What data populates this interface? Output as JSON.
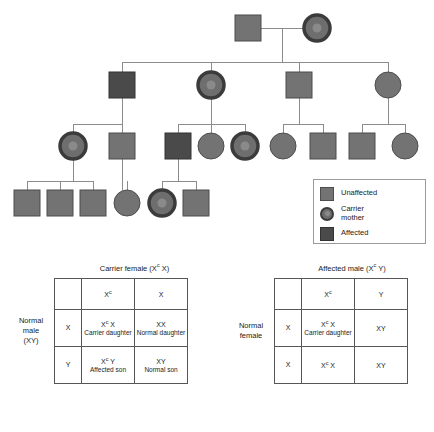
{
  "pedigree": {
    "title": "X-linked recessive inheritance pedigree",
    "colors": {
      "unaffected": "#737373",
      "unaffected_stroke": "#4d4d4d",
      "affected": "#4a4a4a",
      "affected_stroke": "#333333",
      "carrier_ring": "#3b3b3b",
      "carrier_fill": "#6e6e6e",
      "carrier_dot": "#8a8a8a",
      "line": "#8c8c8c"
    },
    "generations": [
      {
        "id": "I",
        "individuals": [
          {
            "name": "gen1-father",
            "shape": "square",
            "status": "unaffected",
            "x": 248,
            "y": 28
          },
          {
            "name": "gen1-mother",
            "shape": "circle",
            "status": "carrier",
            "x": 317,
            "y": 28
          }
        ]
      },
      {
        "id": "II",
        "individuals": [
          {
            "name": "gen2-son-1",
            "shape": "square",
            "status": "affected",
            "x": 122,
            "y": 85
          },
          {
            "name": "gen2-daughter-2",
            "shape": "circle",
            "status": "carrier",
            "x": 211,
            "y": 85
          },
          {
            "name": "gen2-son-3",
            "shape": "square",
            "status": "unaffected",
            "x": 299,
            "y": 85
          },
          {
            "name": "gen2-daughter-4",
            "shape": "circle",
            "status": "unaffected",
            "x": 388,
            "y": 85
          }
        ]
      },
      {
        "id": "III",
        "individuals": [
          {
            "name": "gen3-daughter-1",
            "shape": "circle",
            "status": "carrier",
            "x": 73,
            "y": 146
          },
          {
            "name": "gen3-son-2",
            "shape": "square",
            "status": "unaffected",
            "x": 122,
            "y": 146
          },
          {
            "name": "gen3-son-3",
            "shape": "square",
            "status": "affected",
            "x": 178,
            "y": 146
          },
          {
            "name": "gen3-daughter-4",
            "shape": "circle",
            "status": "unaffected",
            "x": 211,
            "y": 146
          },
          {
            "name": "gen3-daughter-5",
            "shape": "circle",
            "status": "carrier",
            "x": 245,
            "y": 146
          },
          {
            "name": "gen3-daughter-6",
            "shape": "circle",
            "status": "unaffected",
            "x": 283,
            "y": 146
          },
          {
            "name": "gen3-son-7",
            "shape": "square",
            "status": "unaffected",
            "x": 323,
            "y": 146
          },
          {
            "name": "gen3-son-8",
            "shape": "square",
            "status": "unaffected",
            "x": 362,
            "y": 146
          },
          {
            "name": "gen3-daughter-9",
            "shape": "circle",
            "status": "unaffected",
            "x": 405,
            "y": 146
          }
        ]
      },
      {
        "id": "IV",
        "individuals": [
          {
            "name": "gen4-son-1",
            "shape": "square",
            "status": "unaffected",
            "x": 27,
            "y": 203
          },
          {
            "name": "gen4-son-2",
            "shape": "square",
            "status": "unaffected",
            "x": 60,
            "y": 203
          },
          {
            "name": "gen4-son-3",
            "shape": "square",
            "status": "unaffected",
            "x": 93,
            "y": 203
          },
          {
            "name": "gen4-daughter-4",
            "shape": "circle",
            "status": "unaffected",
            "x": 127,
            "y": 203
          },
          {
            "name": "gen4-daughter-5",
            "shape": "circle",
            "status": "carrier",
            "x": 162,
            "y": 203
          },
          {
            "name": "gen4-son-6",
            "shape": "square",
            "status": "unaffected",
            "x": 196,
            "y": 203
          }
        ]
      }
    ]
  },
  "legend": {
    "items": [
      {
        "symbol": "unaffected-square",
        "label": "Unaffected"
      },
      {
        "symbol": "carrier-circle",
        "label": "Carrier\nmother"
      },
      {
        "symbol": "affected-square",
        "label": "Affected"
      }
    ]
  },
  "punnett_left": {
    "title_plain": "Carrier female (Xc X)",
    "title_main": "Carrier female (X",
    "title_sup": "c",
    "title_tail": " X)",
    "side_label": "Normal\nmale\n(XY)",
    "col_headers": [
      {
        "main": "X",
        "sup": "c"
      },
      {
        "main": "X",
        "sup": ""
      }
    ],
    "rows": [
      {
        "gamete": "X",
        "cells": [
          {
            "geno_main": "X",
            "geno_sup": "c",
            "geno_tail": " X",
            "pheno": "Carrier\ndaughter"
          },
          {
            "geno_main": "XX",
            "geno_sup": "",
            "geno_tail": "",
            "pheno": "Normal\ndaughter"
          }
        ]
      },
      {
        "gamete": "Y",
        "cells": [
          {
            "geno_main": "X",
            "geno_sup": "c",
            "geno_tail": " Y",
            "pheno": "Affected\nson"
          },
          {
            "geno_main": "XY",
            "geno_sup": "",
            "geno_tail": "",
            "pheno": "Normal\nson"
          }
        ]
      }
    ]
  },
  "punnett_right": {
    "title_plain": "Affected male (Xc Y)",
    "title_main": "Affected male (X",
    "title_sup": "c",
    "title_tail": " Y)",
    "side_label": "Normal\nfemale",
    "col_headers": [
      {
        "main": "X",
        "sup": "c"
      },
      {
        "main": "Y",
        "sup": ""
      }
    ],
    "rows": [
      {
        "gamete": "X",
        "cells": [
          {
            "geno_main": "X",
            "geno_sup": "c",
            "geno_tail": " X",
            "pheno": "Carrier\ndaughter"
          },
          {
            "geno_main": "XY",
            "geno_sup": "",
            "geno_tail": "",
            "pheno": ""
          }
        ]
      },
      {
        "gamete": "X",
        "cells": [
          {
            "geno_main": "X",
            "geno_sup": "c",
            "geno_tail": " X",
            "pheno": ""
          },
          {
            "geno_main": "XY",
            "geno_sup": "",
            "geno_tail": "",
            "pheno": ""
          }
        ]
      }
    ]
  }
}
